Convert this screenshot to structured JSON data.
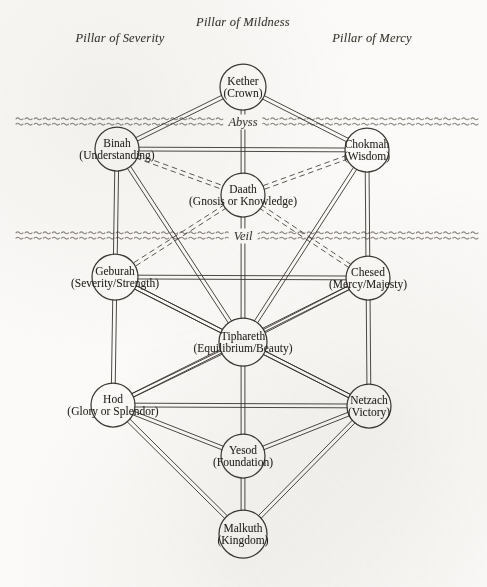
{
  "diagram": {
    "background_color": "#fbfaf8",
    "ink_color": "#35312c"
  },
  "pillars": [
    {
      "id": "severity",
      "label": "Pillar of Severity",
      "x": 120,
      "y": 38
    },
    {
      "id": "mildness",
      "label": "Pillar of Mildness",
      "x": 243,
      "y": 22
    },
    {
      "id": "mercy",
      "label": "Pillar of Mercy",
      "x": 372,
      "y": 38
    }
  ],
  "bands": [
    {
      "id": "abyss",
      "label": "Abyss",
      "y": 122,
      "label_x": 243
    },
    {
      "id": "veil",
      "label": "Veil",
      "y": 236,
      "label_x": 243
    }
  ],
  "nodes": [
    {
      "id": "kether",
      "name": "Kether",
      "sub": "(Crown)",
      "x": 243,
      "y": 87,
      "r": 23,
      "pillar": "mildness",
      "style": "solid"
    },
    {
      "id": "binah",
      "name": "Binah",
      "sub": "(Understanding)",
      "x": 117,
      "y": 149,
      "r": 22,
      "pillar": "severity",
      "style": "solid"
    },
    {
      "id": "chokmah",
      "name": "Chokmah",
      "sub": "(Wisdom)",
      "x": 367,
      "y": 150,
      "r": 22,
      "pillar": "mercy",
      "style": "solid"
    },
    {
      "id": "daath",
      "name": "Daath",
      "sub": "(Gnosis or Knowledge)",
      "x": 243,
      "y": 195,
      "r": 22,
      "pillar": "mildness",
      "style": "dashed"
    },
    {
      "id": "geburah",
      "name": "Geburah",
      "sub": "(Severity/Strength)",
      "x": 115,
      "y": 277,
      "r": 23,
      "pillar": "severity",
      "style": "solid"
    },
    {
      "id": "chesed",
      "name": "Chesed",
      "sub": "(Mercy/Majesty)",
      "x": 368,
      "y": 278,
      "r": 22,
      "pillar": "mercy",
      "style": "solid"
    },
    {
      "id": "tiphareth",
      "name": "Tiphareth",
      "sub": "(Equilibrium/Beauty)",
      "x": 243,
      "y": 342,
      "r": 24,
      "pillar": "mildness",
      "style": "solid"
    },
    {
      "id": "hod",
      "name": "Hod",
      "sub": "(Glory or Splendor)",
      "x": 113,
      "y": 405,
      "r": 22,
      "pillar": "severity",
      "style": "solid"
    },
    {
      "id": "netzach",
      "name": "Netzach",
      "sub": "(Victory)",
      "x": 369,
      "y": 406,
      "r": 22,
      "pillar": "mercy",
      "style": "solid"
    },
    {
      "id": "yesod",
      "name": "Yesod",
      "sub": "(Foundation)",
      "x": 243,
      "y": 456,
      "r": 22,
      "pillar": "mildness",
      "style": "solid"
    },
    {
      "id": "malkuth",
      "name": "Malkuth",
      "sub": "(Kingdom)",
      "x": 243,
      "y": 534,
      "r": 24,
      "pillar": "mildness",
      "style": "solid"
    }
  ],
  "paths": [
    {
      "from": "kether",
      "to": "binah",
      "style": "solid"
    },
    {
      "from": "kether",
      "to": "chokmah",
      "style": "solid"
    },
    {
      "from": "kether",
      "to": "daath",
      "style": "solid"
    },
    {
      "from": "binah",
      "to": "chokmah",
      "style": "solid"
    },
    {
      "from": "binah",
      "to": "daath",
      "style": "dashed"
    },
    {
      "from": "chokmah",
      "to": "daath",
      "style": "dashed"
    },
    {
      "from": "binah",
      "to": "geburah",
      "style": "solid"
    },
    {
      "from": "chokmah",
      "to": "chesed",
      "style": "solid"
    },
    {
      "from": "binah",
      "to": "tiphareth",
      "style": "solid"
    },
    {
      "from": "chokmah",
      "to": "tiphareth",
      "style": "solid"
    },
    {
      "from": "daath",
      "to": "geburah",
      "style": "dashed"
    },
    {
      "from": "daath",
      "to": "chesed",
      "style": "dashed"
    },
    {
      "from": "daath",
      "to": "tiphareth",
      "style": "solid"
    },
    {
      "from": "geburah",
      "to": "chesed",
      "style": "solid"
    },
    {
      "from": "geburah",
      "to": "tiphareth",
      "style": "solid"
    },
    {
      "from": "chesed",
      "to": "tiphareth",
      "style": "solid"
    },
    {
      "from": "geburah",
      "to": "hod",
      "style": "solid"
    },
    {
      "from": "chesed",
      "to": "netzach",
      "style": "solid"
    },
    {
      "from": "geburah",
      "to": "netzach",
      "style": "solid"
    },
    {
      "from": "chesed",
      "to": "hod",
      "style": "solid"
    },
    {
      "from": "tiphareth",
      "to": "hod",
      "style": "solid"
    },
    {
      "from": "tiphareth",
      "to": "netzach",
      "style": "solid"
    },
    {
      "from": "tiphareth",
      "to": "yesod",
      "style": "solid"
    },
    {
      "from": "hod",
      "to": "netzach",
      "style": "solid"
    },
    {
      "from": "hod",
      "to": "yesod",
      "style": "solid"
    },
    {
      "from": "netzach",
      "to": "yesod",
      "style": "solid"
    },
    {
      "from": "hod",
      "to": "malkuth",
      "style": "solid"
    },
    {
      "from": "netzach",
      "to": "malkuth",
      "style": "solid"
    },
    {
      "from": "yesod",
      "to": "malkuth",
      "style": "solid"
    }
  ]
}
